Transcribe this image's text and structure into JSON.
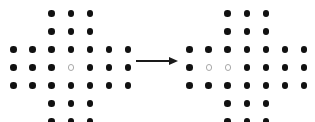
{
  "figure": {
    "background_color": "#ffffff",
    "filled_dot_color": "#111111",
    "hollow_dot_fill": "#ffffff",
    "hollow_dot_border": "#a8a8a8",
    "arrow_color": "#1a1a1a"
  },
  "grid": {
    "columns": 7,
    "rows": 7,
    "column_spacing": 19.1,
    "row_spacing": 18.0,
    "dot_diameter": 6.6,
    "hollow_diameter": 6.2,
    "row_dot_counts": [
      3,
      3,
      7,
      7,
      7,
      3,
      3
    ],
    "shape_name": "plus-cross"
  },
  "patterns": [
    {
      "id": "left-pattern",
      "label": "Left pattern",
      "origin_x": 13.5,
      "origin_y": 13.5,
      "dot_count": 33,
      "filled_count": 32,
      "hollow_count": 1,
      "hollow_cells": [
        [
          3,
          3
        ]
      ],
      "rows": [
        {
          "row": 0,
          "columns": [
            2,
            3,
            4
          ]
        },
        {
          "row": 1,
          "columns": [
            2,
            3,
            4
          ]
        },
        {
          "row": 2,
          "columns": [
            0,
            1,
            2,
            3,
            4,
            5,
            6
          ]
        },
        {
          "row": 3,
          "columns": [
            0,
            1,
            2,
            3,
            4,
            5,
            6
          ]
        },
        {
          "row": 4,
          "columns": [
            0,
            1,
            2,
            3,
            4,
            5,
            6
          ]
        },
        {
          "row": 5,
          "columns": [
            2,
            3,
            4
          ]
        },
        {
          "row": 6,
          "columns": [
            2,
            3,
            4
          ]
        }
      ]
    },
    {
      "id": "right-pattern",
      "label": "Right pattern",
      "origin_x": 189.5,
      "origin_y": 13.5,
      "dot_count": 33,
      "filled_count": 31,
      "hollow_count": 2,
      "hollow_cells": [
        [
          3,
          1
        ],
        [
          3,
          2
        ]
      ],
      "rows": [
        {
          "row": 0,
          "columns": [
            2,
            3,
            4
          ]
        },
        {
          "row": 1,
          "columns": [
            2,
            3,
            4
          ]
        },
        {
          "row": 2,
          "columns": [
            0,
            1,
            2,
            3,
            4,
            5,
            6
          ]
        },
        {
          "row": 3,
          "columns": [
            0,
            1,
            2,
            3,
            4,
            5,
            6
          ]
        },
        {
          "row": 4,
          "columns": [
            0,
            1,
            2,
            3,
            4,
            5,
            6
          ]
        },
        {
          "row": 5,
          "columns": [
            2,
            3,
            4
          ]
        },
        {
          "row": 6,
          "columns": [
            2,
            3,
            4
          ]
        }
      ]
    }
  ],
  "arrow": {
    "label": "transformation arrow",
    "direction": "right",
    "x_start": 136,
    "x_end": 178,
    "y": 61,
    "line_thickness": 1.4,
    "head_length": 9,
    "head_width": 9
  }
}
